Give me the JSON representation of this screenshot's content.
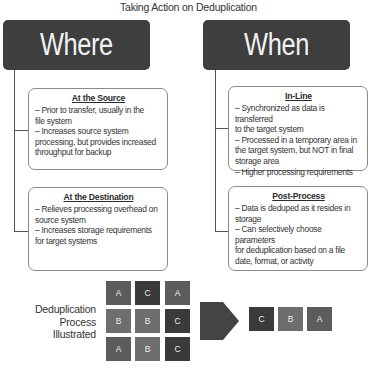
{
  "title": "Taking Action on Deduplication",
  "columns": [
    {
      "header": "Where",
      "cards": [
        {
          "title": "At the Source",
          "lines": [
            "– Prior to transfer, usually in the",
            "file system",
            "– Increases source system",
            "processing, but provides increased",
            "throughput for backup"
          ]
        },
        {
          "title": "At the Destination",
          "lines": [
            "– Relieves processing overhead on",
            "source system",
            "– Increases storage requirements",
            "for target systems"
          ]
        }
      ]
    },
    {
      "header": "When",
      "cards": [
        {
          "title": "In-Line",
          "lines": [
            "– Synchronized as data is transferred",
            "to the target system",
            "– Processed in a temporary area in",
            "the target system, but NOT in final",
            "storage area",
            "– Higher processing requirements"
          ]
        },
        {
          "title": "Post-Process",
          "lines": [
            "– Data is deduped as it resides in",
            "storage",
            "– Can selectively choose parameters",
            "for deduplication based on a file",
            "date, format, or activity"
          ]
        }
      ]
    }
  ],
  "illustration": {
    "label_lines": [
      "Deduplication",
      "Process",
      "Illustrated"
    ],
    "grid": [
      [
        "A",
        "C",
        "A"
      ],
      [
        "B",
        "B",
        "C"
      ],
      [
        "A",
        "B",
        "C"
      ]
    ],
    "result": [
      "C",
      "B",
      "A"
    ],
    "colors": {
      "A": "#5c5c5c",
      "B": "#6e6e6e",
      "C": "#3a3a3a",
      "arrow": "#444444",
      "header": "#3e3e3e"
    }
  }
}
